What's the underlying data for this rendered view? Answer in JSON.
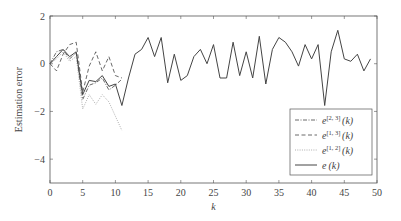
{
  "chart_data": {
    "type": "line",
    "title": "",
    "xlabel": "k",
    "ylabel": "Estimation error",
    "xlim": [
      0,
      50
    ],
    "ylim": [
      -5,
      2
    ],
    "xticks": [
      0,
      5,
      10,
      15,
      20,
      25,
      30,
      35,
      40,
      45,
      50
    ],
    "yticks": [
      -4,
      -2,
      0,
      2
    ],
    "grid": false,
    "legend_position": "lower right (inside)",
    "series": [
      {
        "name": "e^{[2,3]}(k)",
        "label_base": "e",
        "label_sup": "[2, 3]",
        "label_arg": "(k)",
        "style": "dashdot",
        "x": [
          0,
          1,
          2,
          3,
          4,
          5,
          6,
          7,
          8,
          9,
          10,
          11
        ],
        "values": [
          0,
          0.5,
          0.6,
          0.2,
          0.45,
          -1.5,
          -0.9,
          -0.8,
          -0.6,
          -1.1,
          -0.9,
          -0.65
        ]
      },
      {
        "name": "e^{[1,3]}(k)",
        "label_base": "e",
        "label_sup": "[1, 3]",
        "label_arg": "(k)",
        "style": "dashed",
        "x": [
          0,
          1,
          2,
          3,
          4,
          5,
          6,
          7,
          8,
          9,
          10,
          11
        ],
        "values": [
          0,
          -0.3,
          0.4,
          0.8,
          0.9,
          -1.2,
          -0.1,
          0.5,
          -0.3,
          0.3,
          -0.5,
          -0.6
        ]
      },
      {
        "name": "e^{[1,2]}(k)",
        "label_base": "e",
        "label_sup": "[1, 2]",
        "label_arg": "(k)",
        "style": "dotted",
        "x": [
          0,
          1,
          2,
          3,
          4,
          5,
          6,
          7,
          8,
          9,
          10,
          11
        ],
        "values": [
          0,
          0.2,
          0.5,
          0.1,
          0.3,
          -1.9,
          -1.3,
          -1.7,
          -1.3,
          -1.6,
          -2.2,
          -2.8
        ]
      },
      {
        "name": "e(k)",
        "label_base": "e",
        "label_sup": "",
        "label_arg": "(k)",
        "style": "solid",
        "x": [
          0,
          1,
          2,
          3,
          4,
          5,
          6,
          7,
          8,
          9,
          10,
          11,
          12,
          13,
          14,
          15,
          16,
          17,
          18,
          19,
          20,
          21,
          22,
          23,
          24,
          25,
          26,
          27,
          28,
          29,
          30,
          31,
          32,
          33,
          34,
          35,
          36,
          37,
          38,
          39,
          40,
          41,
          42,
          43,
          44,
          45,
          46,
          47,
          48,
          49
        ],
        "values": [
          0,
          0.3,
          0.6,
          0.3,
          0.5,
          -1.3,
          -0.7,
          -0.75,
          -0.5,
          -0.95,
          -0.85,
          -1.75,
          -0.6,
          0.4,
          0.6,
          1.1,
          0.3,
          1.1,
          -0.8,
          0.4,
          -0.7,
          -0.5,
          0.3,
          0.6,
          0.0,
          0.8,
          -0.6,
          -0.6,
          0.9,
          -0.5,
          0.5,
          -0.6,
          1.15,
          -0.85,
          0.6,
          1.1,
          0.9,
          0.5,
          -0.1,
          0.8,
          0.2,
          0.8,
          -1.75,
          0.5,
          1.4,
          0.2,
          0.1,
          0.4,
          -0.3,
          0.2
        ]
      }
    ]
  },
  "colors": {
    "axis": "#555555",
    "line": "#444444",
    "dotted": "#999999",
    "background": "#ffffff"
  },
  "plot_area": {
    "left": 50,
    "right": 377,
    "top": 16,
    "bottom": 183
  }
}
